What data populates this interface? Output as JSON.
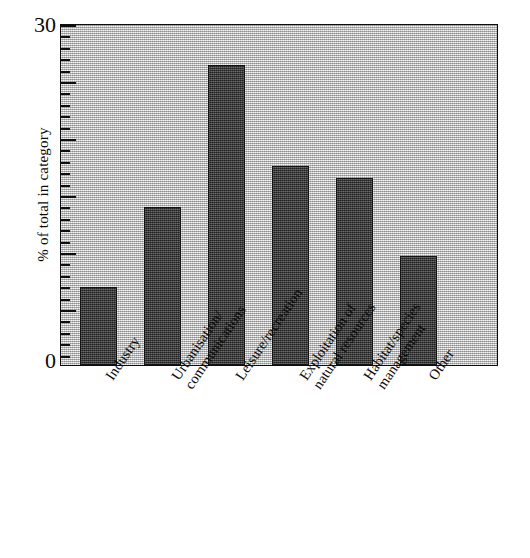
{
  "chart_data": {
    "type": "bar",
    "title": "",
    "xlabel": "",
    "ylabel": "% of total in category",
    "ylim": [
      0,
      30
    ],
    "ytick_labels": [
      "0",
      "30"
    ],
    "ytick_major_interval": 5,
    "ytick_minor_interval": 1,
    "grid": false,
    "legend": "none",
    "bar_color": "#3d3d3d",
    "plot_background_color": "#c9c9c9",
    "axis_color": "#0f0f0f",
    "categories": [
      "Industry",
      "Urbanisation/\ncommunications",
      "Leisure/recreation",
      "Exploitation of\nnatural resources",
      "Habitat/species\nmanagement",
      "Other"
    ],
    "values": [
      6.8,
      13.9,
      26.3,
      17.5,
      16.4,
      9.6
    ]
  },
  "axis": {
    "y_max_label": "30",
    "y_min_label": "0",
    "y_title": "% of total in category"
  }
}
